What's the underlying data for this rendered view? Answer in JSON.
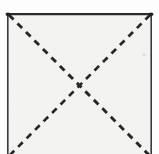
{
  "figure": {
    "title": "Square with dashed diagonals",
    "medium": "scanned-paper-line-drawing",
    "canvas": {
      "width": 159,
      "height": 154,
      "page_background": "#ffffff",
      "paper_fill": "#f4f4f2"
    },
    "square": {
      "name": "square-outline",
      "left": 7.5,
      "top": 13.5,
      "right": 151.5,
      "bottom_visible": 154,
      "bottom_cropped": true,
      "stroke_color": "#2b2b2b",
      "stroke_width": 1.6,
      "top_edge_stroke_width": 2.2,
      "style": "solid"
    },
    "diagonals": [
      {
        "name": "diagonal-top-left-to-bottom-right",
        "x1": 9,
        "y1": 15,
        "x2": 152,
        "y2": 158,
        "style": "dashed",
        "dash_length": 6.5,
        "gap_length": 5.5,
        "stroke_color": "#262626",
        "stroke_width": 2.9
      },
      {
        "name": "diagonal-top-right-to-bottom-left",
        "x1": 150,
        "y1": 15,
        "x2": 7,
        "y2": 158,
        "style": "dashed",
        "dash_length": 6.5,
        "gap_length": 5.5,
        "stroke_color": "#262626",
        "stroke_width": 2.7
      }
    ],
    "intersection": {
      "name": "diagonals-intersection",
      "x": 79.5,
      "y": 84.5,
      "label": ""
    },
    "artifacts": [
      {
        "name": "scan-speck",
        "x": 144,
        "y": 55,
        "size": 3,
        "color": "#d8d8d8"
      }
    ],
    "labels": []
  }
}
